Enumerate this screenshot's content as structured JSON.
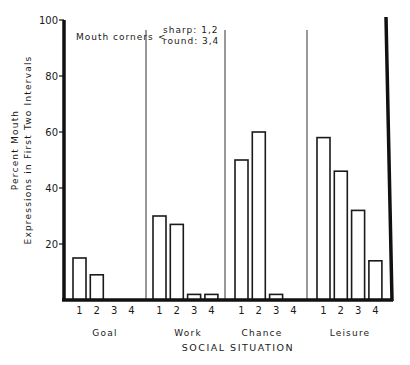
{
  "chart_data": {
    "type": "bar",
    "title": "",
    "xlabel": "SOCIAL SITUATION",
    "ylabel": [
      "Percent Mouth",
      "Expressions in First Two Intervals"
    ],
    "ylim": [
      0,
      100
    ],
    "yticks": [
      20,
      40,
      60,
      80,
      100
    ],
    "grid": false,
    "legend_annotation": {
      "prefix": "Mouth corners",
      "lines": [
        "sharp: 1,2",
        "round: 3,4"
      ]
    },
    "categories": [
      "Goal",
      "Work",
      "Chance",
      "Leisure"
    ],
    "subcategories": [
      "1",
      "2",
      "3",
      "4"
    ],
    "series": [
      {
        "name": "1 (sharp)",
        "values": [
          15,
          30,
          50,
          58
        ]
      },
      {
        "name": "2 (sharp)",
        "values": [
          9,
          27,
          60,
          46
        ]
      },
      {
        "name": "3 (round)",
        "values": [
          0,
          2,
          2,
          32
        ]
      },
      {
        "name": "4 (round)",
        "values": [
          0,
          2,
          0,
          14
        ]
      }
    ]
  },
  "labels": {
    "y_line1": "Percent Mouth",
    "y_line2": "Expressions in First Two Intervals",
    "annotation_prefix": "Mouth corners",
    "annotation_sharp": "sharp: 1,2",
    "annotation_round": "round: 3,4",
    "x_title": "SOCIAL SITUATION"
  }
}
